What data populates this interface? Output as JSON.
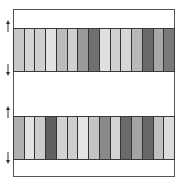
{
  "diagram": {
    "frame": {
      "stroke": "#555555",
      "fill": "#ffffff"
    },
    "bands": [
      {
        "position": "top",
        "stripe_colors": [
          "#c8c8c8",
          "#d4d4d4",
          "#cfcfcf",
          "#e2e2e2",
          "#bcbcbc",
          "#d0d0d0",
          "#9a9a9a",
          "#707070",
          "#e0e0e0",
          "#d0d0d0",
          "#d6d6d6",
          "#b8b8b8",
          "#6a6a6a",
          "#a8a8a8",
          "#7a7a7a"
        ],
        "arrows": [
          "up-arrow",
          "down-arrow"
        ]
      },
      {
        "position": "bottom",
        "stripe_colors": [
          "#b0b0b0",
          "#e2e2e2",
          "#cccccc",
          "#606060",
          "#d2d2d2",
          "#cecece",
          "#e4e4e4",
          "#c4c4c4",
          "#8a8a8a",
          "#d4d4d4",
          "#6a6a6a",
          "#a4a4a4",
          "#686868",
          "#c0c0c0",
          "#dcdcdc"
        ],
        "arrows": [
          "up-arrow",
          "down-arrow"
        ]
      }
    ],
    "stripe_count_per_band": 15
  }
}
